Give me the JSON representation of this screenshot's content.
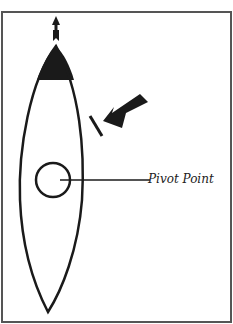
{
  "diagram": {
    "type": "boat-pivot-point",
    "labels": {
      "pivot": "Pivot Point"
    },
    "elements": [
      {
        "name": "frame",
        "description": "rectangular border"
      },
      {
        "name": "boat-hull",
        "description": "elongated pointed hull outline, bow at top"
      },
      {
        "name": "bow-fill",
        "description": "black filled bow section"
      },
      {
        "name": "heading-arrow",
        "description": "small arrow above bow pointing up"
      },
      {
        "name": "force-arrow",
        "description": "large black arrow pushing toward starboard bow"
      },
      {
        "name": "impact-line",
        "description": "short line where force contacts hull"
      },
      {
        "name": "pivot-circle",
        "description": "circle marking pivot point"
      },
      {
        "name": "pivot-leader-line",
        "description": "line from circle to label"
      }
    ],
    "colors": {
      "stroke": "#1a1a1a",
      "background": "#ffffff",
      "frame": "#555555"
    }
  }
}
